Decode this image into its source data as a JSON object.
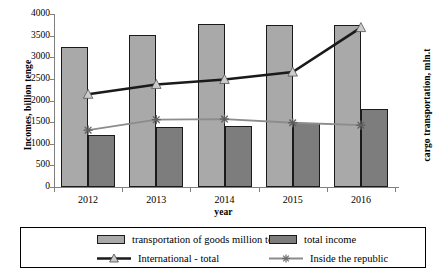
{
  "chart_data": {
    "type": "bar",
    "title": "",
    "xlabel": "year",
    "ylabel": "Incomes, billion tenge",
    "y2label": "cargo transportation, mln.t",
    "categories": [
      "2012",
      "2013",
      "2014",
      "2015",
      "2016"
    ],
    "ylim": [
      0,
      4000
    ],
    "ytick_labels": [
      "0",
      "500",
      "1000",
      "1500",
      "2000",
      "2500",
      "3000",
      "3500",
      "4000"
    ],
    "ytick_values": [
      0,
      500,
      1000,
      1500,
      2000,
      2500,
      3000,
      3500,
      4000
    ],
    "grid": false,
    "legend_position": "bottom",
    "series": [
      {
        "name": "transportation of goods million tons",
        "kind": "bar",
        "axis": "left",
        "color": "#a9a9a9",
        "values": [
          3230,
          3510,
          3760,
          3750,
          3745
        ]
      },
      {
        "name": "total income",
        "kind": "bar",
        "axis": "left",
        "color": "#7d7d7d",
        "values": [
          1210,
          1390,
          1410,
          1490,
          1800
        ]
      },
      {
        "name": "International - total",
        "kind": "line",
        "axis": "right",
        "color": "#1a1a1a",
        "marker": "triangle",
        "values": [
          750,
          830,
          870,
          930,
          1290
        ]
      },
      {
        "name": "Inside the republic",
        "kind": "line",
        "axis": "right",
        "color": "#8c8c8c",
        "marker": "star",
        "values": [
          460,
          545,
          550,
          520,
          500
        ]
      }
    ]
  },
  "axes": {
    "y_left_title": "Incomes, billion tenge",
    "y_right_title": "cargo transportation, mln.t",
    "x_title": "year"
  },
  "legend": {
    "items": [
      {
        "label": "transportation of goods million tons",
        "type": "swatch-light"
      },
      {
        "label": "total income",
        "type": "swatch-dark"
      },
      {
        "label": "International - total",
        "type": "line-dark-triangle"
      },
      {
        "label": "Inside the republic",
        "type": "line-gray-star"
      }
    ]
  }
}
